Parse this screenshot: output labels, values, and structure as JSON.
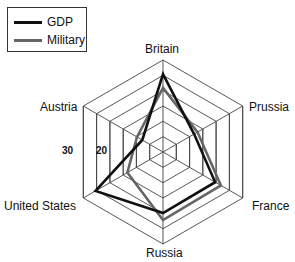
{
  "chart_data": {
    "type": "radar",
    "title": "",
    "categories": [
      "Britain",
      "Prussia",
      "France",
      "Russia",
      "United States",
      "Austria"
    ],
    "series": [
      {
        "name": "GDP",
        "color": "#111111",
        "values": [
          25.4,
          11.7,
          19.6,
          19.9,
          25.4,
          7.8
        ]
      },
      {
        "name": "Military",
        "color": "#666666",
        "values": [
          20.9,
          13.0,
          21.8,
          22.2,
          13.4,
          9.8
        ]
      }
    ],
    "rmax": 30,
    "rings": 6,
    "tick_labels": [
      "30",
      "20"
    ],
    "legend_position": "top-left",
    "grid": true
  },
  "legend": {
    "items": [
      {
        "label": "GDP",
        "color": "#111111"
      },
      {
        "label": "Military",
        "color": "#666666"
      }
    ]
  },
  "axes": {
    "britain": "Britain",
    "prussia": "Prussia",
    "france": "France",
    "russia": "Russia",
    "united_states": "United States",
    "austria": "Austria"
  },
  "ticks": {
    "t30": "30",
    "t20": "20"
  }
}
